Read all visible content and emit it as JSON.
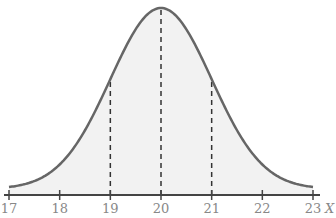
{
  "chart_data": {
    "type": "area",
    "title": "",
    "distribution": {
      "mean": 20,
      "sd": 1
    },
    "xlabel": "X",
    "ylabel": "",
    "xlim": [
      17,
      23
    ],
    "x_ticks": [
      17,
      18,
      19,
      20,
      21,
      22,
      23
    ],
    "x_tick_labels": [
      "17",
      "18",
      "19",
      "20",
      "21",
      "22",
      "23"
    ],
    "dashed_lines_at": [
      19,
      20,
      21
    ],
    "grid": false,
    "legend": null,
    "colors": {
      "curve": "#666666",
      "fill": "#f2f2f2",
      "axis": "#444444",
      "labels": "#888888"
    }
  }
}
